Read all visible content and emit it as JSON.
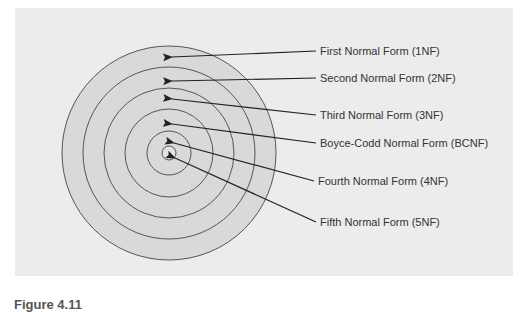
{
  "diagram": {
    "center": {
      "x": 169,
      "y": 153
    },
    "ring_fill": "#d9d9d9",
    "ring_stroke": "#555555",
    "background": "#ececec",
    "rings": [
      {
        "label": "First Normal Form (1NF)",
        "radius": 107,
        "arrow_tip": [
          172,
          57
        ],
        "label_x": 320,
        "label_y": 51
      },
      {
        "label": "Second Normal Form (2NF)",
        "radius": 86,
        "arrow_tip": [
          172,
          81
        ],
        "label_x": 320,
        "label_y": 78
      },
      {
        "label": "Third Normal Form (3NF)",
        "radius": 65,
        "arrow_tip": [
          172,
          99
        ],
        "label_x": 320,
        "label_y": 115
      },
      {
        "label": "Boyce-Codd Normal Form (BCNF)",
        "radius": 44,
        "arrow_tip": [
          172,
          124
        ],
        "label_x": 320,
        "label_y": 143
      },
      {
        "label": "Fourth Normal Form (4NF)",
        "radius": 22,
        "arrow_tip": [
          174,
          143
        ],
        "label_x": 318,
        "label_y": 181
      },
      {
        "label": "Fifth Normal Form (5NF)",
        "radius": 7,
        "arrow_tip": [
          175,
          158
        ],
        "label_x": 320,
        "label_y": 222
      }
    ]
  },
  "caption": "Figure 4.11"
}
